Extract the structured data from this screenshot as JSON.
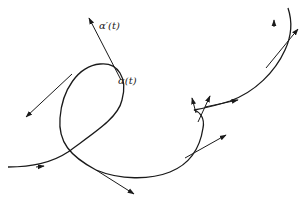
{
  "figure": {
    "labels": {
      "derivative": "α′(t)",
      "point": "α(t)"
    },
    "colors": {
      "stroke": "#1a1a1a",
      "background": "#ffffff"
    }
  }
}
